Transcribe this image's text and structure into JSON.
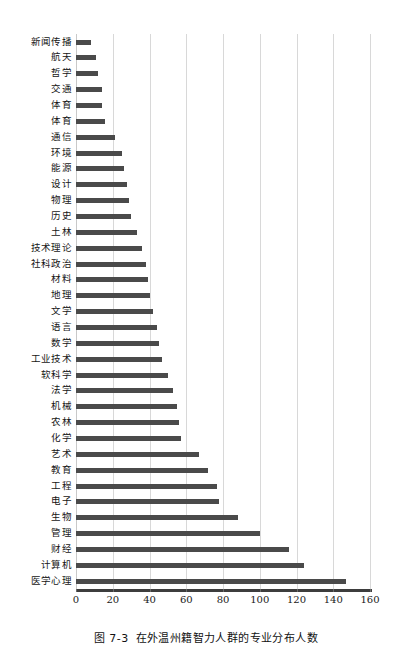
{
  "caption": {
    "figure_number": "图 7-3",
    "text": "在外温州籍智力人群的专业分布人数"
  },
  "chart_data": {
    "type": "bar",
    "orientation": "horizontal",
    "title": "在外温州籍智力人群的专业分布人数",
    "xlabel": "",
    "ylabel": "",
    "xlim": [
      0,
      160
    ],
    "xticks": [
      0,
      20,
      40,
      60,
      80,
      100,
      120,
      140,
      160
    ],
    "grid": "vertical",
    "legend": "none",
    "bar_color": "#4a4a4a",
    "gridline_color": "#d8d8d8",
    "axis_color": "#3d3d3d",
    "categories": [
      "新闻传播",
      "航天",
      "哲学",
      "交通",
      "体育",
      "体育",
      "通信",
      "环境",
      "能源",
      "设计",
      "物理",
      "历史",
      "土林",
      "技术理论",
      "社科政治",
      "材料",
      "地理",
      "文学",
      "语言",
      "数学",
      "工业技术",
      "软科学",
      "法学",
      "机械",
      "农林",
      "化学",
      "艺术",
      "教育",
      "工程",
      "电子",
      "生物",
      "管理",
      "财经",
      "计算机",
      "医学心理"
    ],
    "values": [
      8,
      11,
      12,
      14,
      14,
      16,
      21,
      25,
      26,
      28,
      29,
      30,
      33,
      36,
      38,
      39,
      40,
      42,
      44,
      45,
      47,
      50,
      53,
      55,
      56,
      57,
      67,
      72,
      77,
      78,
      88,
      100,
      116,
      124,
      147
    ]
  }
}
